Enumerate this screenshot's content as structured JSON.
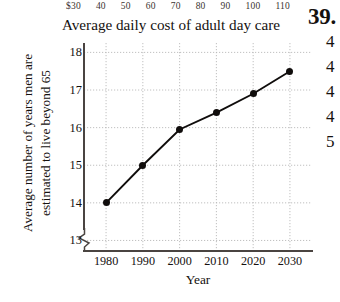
{
  "top_scale": {
    "name": "cost-scale-row",
    "values": [
      "$30",
      "40",
      "50",
      "60",
      "70",
      "80",
      "90",
      "100",
      "110"
    ]
  },
  "chart_caption": "Average daily cost of adult day care",
  "right_column": {
    "exercise_number": "39.",
    "clipped_lines": [
      "4",
      "4",
      "4",
      "4",
      "5"
    ]
  },
  "chart_data": {
    "type": "line",
    "title": "",
    "xlabel": "Year",
    "ylabel_lines": [
      "Average number of years men are",
      "estimated to live beyond 65"
    ],
    "ylabel": "Average number of years men are estimated to live beyond 65",
    "categories": [
      1980,
      1990,
      2000,
      2010,
      2020,
      2030
    ],
    "xtick_labels": [
      "1980",
      "1990",
      "2000",
      "2010",
      "2020",
      "2030"
    ],
    "values": [
      14.0,
      15.0,
      15.95,
      16.4,
      16.9,
      17.5
    ],
    "ytick_labels": [
      "13",
      "14",
      "15",
      "16",
      "17",
      "18"
    ],
    "yticks": [
      13,
      14,
      15,
      16,
      17,
      18
    ],
    "ylim": [
      12.72,
      18.25
    ],
    "xlim": [
      1974,
      2036
    ],
    "grid": true,
    "grid_style": "dotted",
    "axis_break": true,
    "legend": "none",
    "marker": "filled-circle",
    "line_color": "#100d0c",
    "grid_color": "#b9b9b9",
    "axis_color": "#4a4441",
    "background": "#ffffff"
  }
}
